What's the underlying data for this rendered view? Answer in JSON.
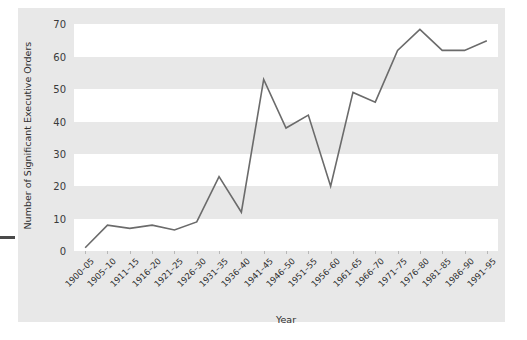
{
  "chart_data": {
    "type": "line",
    "title": "",
    "xlabel": "Year",
    "ylabel": "Number of Significant Executive Orders",
    "ylim": [
      0,
      72
    ],
    "xlim": [
      0,
      19
    ],
    "yticks": [
      0,
      10,
      20,
      30,
      40,
      50,
      60,
      70
    ],
    "grid": "horizontal-banded",
    "legend": "none",
    "line_color": "#6b6b6b",
    "band_color": "#ffffff",
    "background_color": "#e8e8e8",
    "categories": [
      "1900–05",
      "1905–10",
      "1911–15",
      "1916–20",
      "1921–25",
      "1926–30",
      "1931–35",
      "1936–40",
      "1941–45",
      "1946–50",
      "1951–55",
      "1956–60",
      "1961–65",
      "1966–70",
      "1971–75",
      "1976–80",
      "1981–85",
      "1986–90",
      "1991–95"
    ],
    "values": [
      1,
      8,
      7,
      8,
      6.5,
      9,
      23,
      12,
      53,
      38,
      42,
      20,
      49,
      46,
      62,
      68.5,
      62,
      62,
      65
    ]
  }
}
